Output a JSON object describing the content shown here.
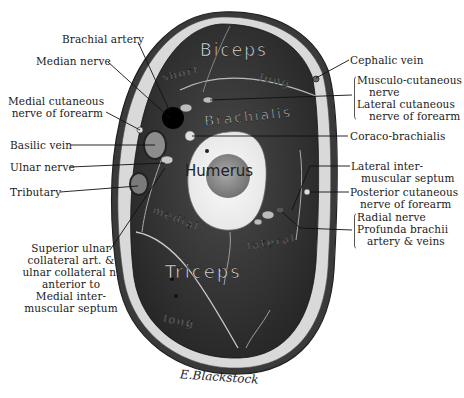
{
  "figure": {
    "signature": "E.Blackstock",
    "colors": {
      "background": "#ffffff",
      "muscle": "#2e2e2e",
      "skin": "#cfcfcf",
      "fat": "#dcdcdc",
      "bone": "#f2f2f2",
      "marrow": "#8a8a8a",
      "artery": "#000000",
      "label_text": "#1a1a1a"
    }
  },
  "structures": {
    "biceps": "Biceps",
    "biceps_short": "short",
    "biceps_long": "long",
    "brachialis": "Brachialis",
    "humerus": "Humerus",
    "triceps": "Triceps",
    "triceps_medial": "medial",
    "triceps_lateral": "lateral",
    "triceps_long": "long"
  },
  "labels_left": [
    {
      "id": "brachial-artery",
      "text": [
        "Brachial artery"
      ]
    },
    {
      "id": "median-nerve",
      "text": [
        "Median nerve"
      ]
    },
    {
      "id": "medial-cutaneous-nerve",
      "text": [
        "Medial cutaneous",
        "nerve of forearm"
      ]
    },
    {
      "id": "basilic-vein",
      "text": [
        "Basilic vein"
      ]
    },
    {
      "id": "ulnar-nerve",
      "text": [
        "Ulnar nerve"
      ]
    },
    {
      "id": "tributary",
      "text": [
        "Tributary"
      ]
    },
    {
      "id": "superior-ulnar-collateral",
      "text": [
        "Superior ulnar",
        "collateral art. &",
        "ulnar collateral n.",
        "anterior to",
        "Medial inter-",
        "muscular septum"
      ]
    }
  ],
  "labels_right": [
    {
      "id": "cephalic-vein",
      "text": [
        "Cephalic vein"
      ]
    },
    {
      "id": "musculo-cutaneous-group",
      "text": [
        "Musculo-cutaneous",
        "nerve",
        "Lateral cutaneous",
        "nerve of forearm"
      ]
    },
    {
      "id": "coraco-brachialis",
      "text": [
        "Coraco-brachialis"
      ]
    },
    {
      "id": "lateral-intermuscular-septum",
      "text": [
        "Lateral inter-",
        "muscular septum"
      ]
    },
    {
      "id": "posterior-cutaneous-nerve",
      "text": [
        "Posterior cutaneous",
        "nerve of forearm"
      ]
    },
    {
      "id": "radial-nerve-group",
      "text": [
        "Radial nerve",
        "Profunda brachii",
        "artery & veins"
      ]
    }
  ]
}
